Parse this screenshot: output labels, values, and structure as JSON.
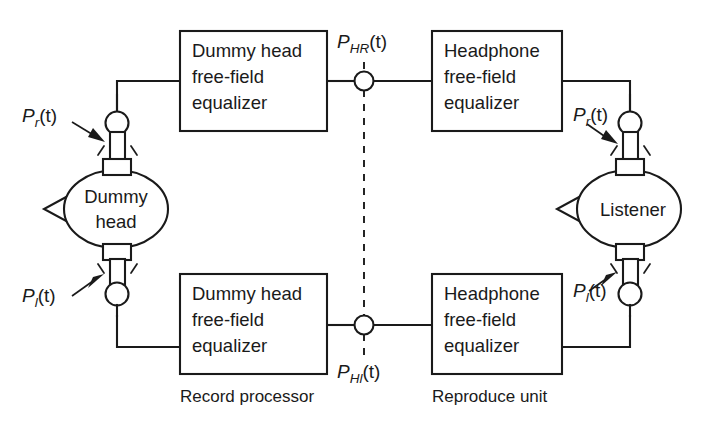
{
  "figure": {
    "background_color": "#ffffff",
    "line_color": "#1a1a1a"
  },
  "blocks": {
    "record_top": {
      "lines": [
        "Dummy head",
        "free-field",
        "equalizer"
      ],
      "line1": "Dummy head",
      "line2": "free-field",
      "line3": "equalizer"
    },
    "record_bottom": {
      "line1": "Dummy head",
      "line2": "free-field",
      "line3": "equalizer"
    },
    "reproduce_top": {
      "line1": "Headphone",
      "line2": "free-field",
      "line3": "equalizer"
    },
    "reproduce_bottom": {
      "line1": "Headphone",
      "line2": "free-field",
      "line3": "equalizer"
    }
  },
  "heads": {
    "dummy": {
      "line1": "Dummy",
      "line2": "head"
    },
    "listener": {
      "label": "Listener"
    }
  },
  "captions": {
    "record": "Record processor",
    "reproduce": "Reproduce unit"
  },
  "signals": {
    "dummy_right": {
      "base": "P",
      "sub": "r",
      "arg": "(t)"
    },
    "dummy_left": {
      "base": "P",
      "sub": "l",
      "arg": "(t)"
    },
    "node_top": {
      "base": "P",
      "sub": "HR",
      "arg": "(t)"
    },
    "node_bottom": {
      "base": "P",
      "sub": "Hl",
      "arg": "(t)"
    },
    "listener_right": {
      "base": "P",
      "sub": "r",
      "arg": "(t)"
    },
    "listener_left": {
      "base": "P",
      "sub": "l",
      "arg": "(t)"
    }
  }
}
